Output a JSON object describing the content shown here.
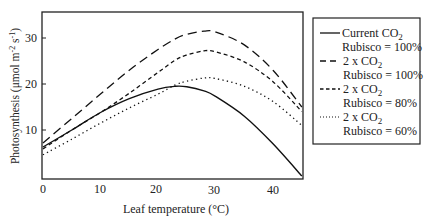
{
  "chart_data": {
    "type": "line",
    "title": "",
    "xlabel": "Leaf temperature (°C)",
    "ylabel": "Photosynthesis (μmol m⁻² s⁻¹)",
    "xlim": [
      0,
      45
    ],
    "ylim": [
      0,
      35
    ],
    "xticks": [
      0,
      10,
      20,
      30,
      40
    ],
    "yticks": [
      10,
      20,
      30
    ],
    "grid": false,
    "legend_position": "right-outside",
    "x": [
      0,
      5,
      10,
      15,
      20,
      23,
      25,
      28,
      30,
      35,
      40,
      45
    ],
    "series": [
      {
        "name": "Current CO2 Rubisco = 100%",
        "legend_line1": "Current CO",
        "legend_line2": "Rubisco = 100%",
        "style": "solid",
        "values": [
          6.3,
          10.0,
          13.8,
          16.8,
          18.9,
          19.5,
          19.4,
          18.5,
          17.3,
          13.0,
          7.0,
          0.0
        ]
      },
      {
        "name": "2 x CO2 Rubisco = 100%",
        "legend_line1": "2 x CO",
        "legend_line2": "Rubisco = 100%",
        "style": "long-dash",
        "values": [
          7.2,
          12.5,
          17.8,
          23.0,
          27.5,
          29.8,
          30.8,
          31.5,
          31.3,
          28.5,
          23.0,
          15.0
        ]
      },
      {
        "name": "2 x CO2 Rubisco = 80%",
        "legend_line1": "2 x CO",
        "legend_line2": "Rubisco = 80%",
        "style": "short-dash",
        "values": [
          5.9,
          10.0,
          13.8,
          18.0,
          22.5,
          25.2,
          26.3,
          27.2,
          27.0,
          24.8,
          20.5,
          14.0
        ]
      },
      {
        "name": "2 x CO2 Rubisco = 60%",
        "legend_line1": "2 x CO",
        "legend_line2": "Rubisco = 60%",
        "style": "dotted",
        "values": [
          4.6,
          8.0,
          11.5,
          14.8,
          17.8,
          19.8,
          20.6,
          21.3,
          21.2,
          19.5,
          16.2,
          11.0
        ]
      }
    ]
  },
  "axes": {
    "xlabel": "Leaf temperature (°C)",
    "ylabel_main": "Photosynthesis (μmol m",
    "ylabel_sup1": "-2",
    "ylabel_mid": " s",
    "ylabel_sup2": "-1",
    "ylabel_end": ")",
    "xtick_labels": [
      "0",
      "10",
      "20",
      "30",
      "40"
    ],
    "ytick_labels": [
      "10",
      "20",
      "30"
    ]
  },
  "legend": {
    "subscript": "2",
    "items": [
      {
        "line1": "Current CO",
        "line2": "Rubisco = 100%"
      },
      {
        "line1": "2 x CO",
        "line2": "Rubisco = 100%"
      },
      {
        "line1": "2 x CO",
        "line2": "Rubisco = 80%"
      },
      {
        "line1": "2 x CO",
        "line2": "Rubisco = 60%"
      }
    ]
  }
}
